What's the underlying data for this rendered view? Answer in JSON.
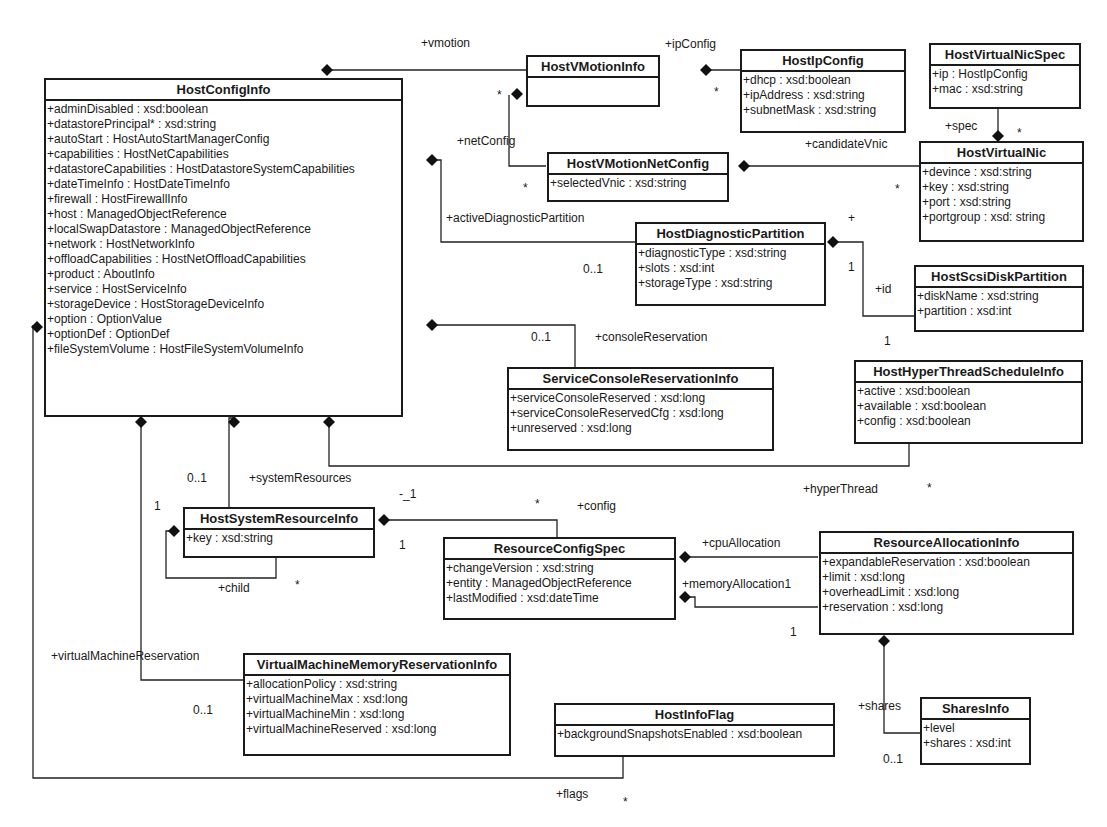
{
  "classes": {
    "hostConfigInfo": {
      "name": "HostConfigInfo",
      "attributes": [
        "+adminDisabled : xsd:boolean",
        "+datastorePrincipal* : xsd:string",
        "+autoStart : HostAutoStartManagerConfig",
        "+capabilities : HostNetCapabilities",
        "+datastoreCapabilities : HostDatastoreSystemCapabilities",
        "+dateTimeInfo : HostDateTimeInfo",
        "+firewall : HostFirewallInfo",
        "+host : ManagedObjectReference",
        "+localSwapDatastore : ManagedObjectReference",
        "+network : HostNetworkInfo",
        "+offloadCapabilities : HostNetOffloadCapabilities",
        "+product : AboutInfo",
        "+service : HostServiceInfo",
        "+storageDevice : HostStorageDeviceInfo",
        "+option : OptionValue",
        "+optionDef : OptionDef",
        "+fileSystemVolume : HostFileSystemVolumeInfo"
      ]
    },
    "hostVMotionInfo": {
      "name": "HostVMotionInfo",
      "attributes": []
    },
    "hostIpConfig": {
      "name": "HostIpConfig",
      "attributes": [
        "+dhcp : xsd:boolean",
        "+ipAddress : xsd:string",
        "+subnetMask : xsd:string"
      ]
    },
    "hostVirtualNicSpec": {
      "name": "HostVirtualNicSpec",
      "attributes": [
        "+ip : HostIpConfig",
        "+mac : xsd:string"
      ]
    },
    "hostVMotionNetConfig": {
      "name": "HostVMotionNetConfig",
      "attributes": [
        "+selectedVnic : xsd:string"
      ]
    },
    "hostVirtualNic": {
      "name": "HostVirtualNic",
      "attributes": [
        "+devince : xsd:string",
        "+key : xsd:string",
        "+port : xsd:string",
        "+portgroup : xsd: string"
      ]
    },
    "hostDiagnosticPartition": {
      "name": "HostDiagnosticPartition",
      "attributes": [
        "+diagnosticType : xsd:string",
        "+slots : xsd:int",
        "+storageType : xsd:string"
      ]
    },
    "hostScsiDiskPartition": {
      "name": "HostScsiDiskPartition",
      "attributes": [
        "+diskName : xsd:string",
        "+partition : xsd:int"
      ]
    },
    "serviceConsoleReservationInfo": {
      "name": "ServiceConsoleReservationInfo",
      "attributes": [
        "+serviceConsoleReserved : xsd:long",
        "+serviceConsoleReservedCfg : xsd:long",
        "+unreserved : xsd:long"
      ]
    },
    "hostHyperThreadScheduleInfo": {
      "name": "HostHyperThreadScheduleInfo",
      "attributes": [
        "+active : xsd:boolean",
        "+available : xsd:boolean",
        "+config : xsd:boolean"
      ]
    },
    "hostSystemResourceInfo": {
      "name": "HostSystemResourceInfo",
      "attributes": [
        "+key : xsd:string"
      ]
    },
    "resourceConfigSpec": {
      "name": "ResourceConfigSpec",
      "attributes": [
        "+changeVersion : xsd:string",
        "+entity : ManagedObjectReference",
        "+lastModified : xsd:dateTime"
      ]
    },
    "resourceAllocationInfo": {
      "name": "ResourceAllocationInfo",
      "attributes": [
        "+expandableReservation : xsd:boolean",
        "+limit : xsd:long",
        "+overheadLimit : xsd:long",
        "+reservation : xsd:long"
      ]
    },
    "virtualMachineMemoryReservationInfo": {
      "name": "VirtualMachineMemoryReservationInfo",
      "attributes": [
        "+allocationPolicy : xsd:string",
        "+virtualMachineMax : xsd:long",
        "+virtualMachineMin : xsd:long",
        "+virtualMachineReserved : xsd:long"
      ]
    },
    "hostInfoFlag": {
      "name": "HostInfoFlag",
      "attributes": [
        "+backgroundSnapshotsEnabled : xsd:boolean"
      ]
    },
    "sharesInfo": {
      "name": "SharesInfo",
      "attributes": [
        "+level",
        "+shares : xsd:int"
      ]
    }
  },
  "labels": {
    "vmotion": "+vmotion",
    "ipConfig": "+ipConfig",
    "ipConfigMult": "*",
    "vmotionNetMult": "*",
    "netConfig": "+netConfig",
    "netConfigMult": "*",
    "candidateVnic": "+candidateVnic",
    "candidateVnicMult": "*",
    "spec": "+spec",
    "specMult": "*",
    "activeDiagnosticPartition": "+activeDiagnosticPartition",
    "diagMult": "0..1",
    "plusMark": "+",
    "idOne": "1",
    "id": "+id",
    "idOneBottom": "1",
    "consoleMult": "0..1",
    "consoleReservation": "+consoleReservation",
    "hyperThread": "+hyperThread",
    "hyperThreadMult": "*",
    "systemResourcesMult": "0..1",
    "systemResources": "+systemResources",
    "vmrOne": "1",
    "configOne": "-_1",
    "configStar": "*",
    "config": "+config",
    "hsrOne": "1",
    "child": "+child",
    "childMult": "*",
    "cpuAllocation": "+cpuAllocation",
    "memoryAllocation": "+memoryAllocation1",
    "raOne": "1",
    "virtualMachineReservation": "+virtualMachineReservation",
    "vmrMult": "0..1",
    "shares": "+shares",
    "sharesMult": "0..1",
    "flags": "+flags",
    "flagsMult": "*"
  }
}
